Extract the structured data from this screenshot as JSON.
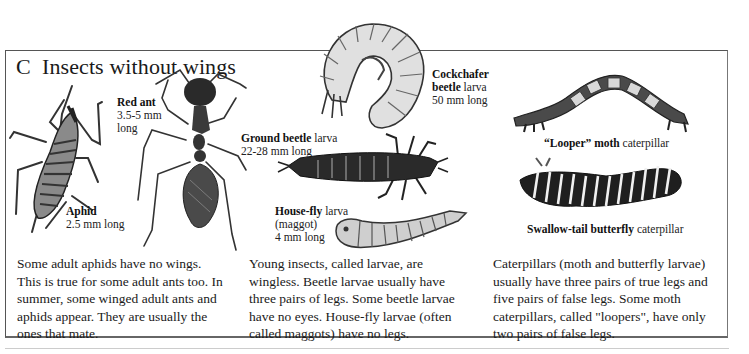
{
  "section": {
    "letter": "C",
    "title": "Insects without wings"
  },
  "labels": {
    "red_ant": {
      "name": "Red ant",
      "size": "3.5-5 mm",
      "suffix": "long"
    },
    "aphid": {
      "name": "Aphid",
      "size": "2.5 mm long"
    },
    "cockchafer": {
      "name_line1": "Cockchafer",
      "name_line2": "beetle",
      "stage": "larva",
      "size": "50 mm long"
    },
    "ground_beetle": {
      "name": "Ground beetle",
      "stage": "larva",
      "size": "22-28 mm long"
    },
    "house_fly": {
      "name": "House-fly",
      "stage": "larva",
      "alt": "(maggot)",
      "size": "4 mm long"
    },
    "looper": {
      "name": "“Looper” moth",
      "stage": "caterpillar"
    },
    "swallowtail": {
      "name": "Swallow-tail butterfly",
      "stage": "caterpillar"
    }
  },
  "paragraphs": {
    "col1": [
      "Some adult aphids have no wings.",
      "This is true for some adult ants too. In",
      "summer, some winged adult ants and",
      "aphids appear. They are usually the",
      "ones that mate."
    ],
    "col2": [
      "Young insects, called larvae, are",
      "wingless. Beetle larvae usually have",
      "three pairs of legs. Some beetle larvae",
      "have no eyes. House-fly larvae (often",
      "called maggots) have no legs."
    ],
    "col3": [
      "Caterpillars (moth and butterfly larvae)",
      "usually have three pairs of true legs and",
      "five pairs of false legs. Some moth",
      "caterpillars, called \"loopers\", have only",
      "two pairs of false legs."
    ]
  },
  "illustrations": [
    "aphid-illustration",
    "red-ant-illustration",
    "cockchafer-larva-illustration",
    "ground-beetle-larva-illustration",
    "house-fly-larva-illustration",
    "looper-caterpillar-illustration",
    "swallowtail-caterpillar-illustration"
  ],
  "colors": {
    "frame": "#555555",
    "text": "#1a1a1a",
    "ink": "#2a2a2a"
  }
}
